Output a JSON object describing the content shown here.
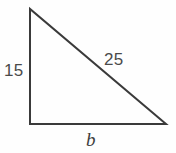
{
  "figure": {
    "kind": "right-triangle-diagram",
    "background_color": "#fefefe",
    "stroke_color": "#3a3a3a",
    "stroke_width": 2,
    "text_color": "#4a4a4a",
    "vertices": {
      "apex": {
        "x": 30,
        "y": 9
      },
      "right_angle": {
        "x": 30,
        "y": 124
      },
      "base_right": {
        "x": 166,
        "y": 124
      }
    },
    "sides": [
      {
        "name": "vertical-leg",
        "label": "15",
        "from": "apex",
        "to": "right_angle",
        "label_position": {
          "x": 4,
          "y": 62
        }
      },
      {
        "name": "hypotenuse",
        "label": "25",
        "from": "apex",
        "to": "base_right",
        "label_position": {
          "x": 104,
          "y": 51
        }
      },
      {
        "name": "horizontal-leg",
        "label": "b",
        "from": "right_angle",
        "to": "base_right",
        "label_position": {
          "x": 86,
          "y": 130
        },
        "italic": true
      }
    ]
  },
  "labels": {
    "leg_a": "15",
    "hypotenuse": "25",
    "leg_b": "b"
  }
}
